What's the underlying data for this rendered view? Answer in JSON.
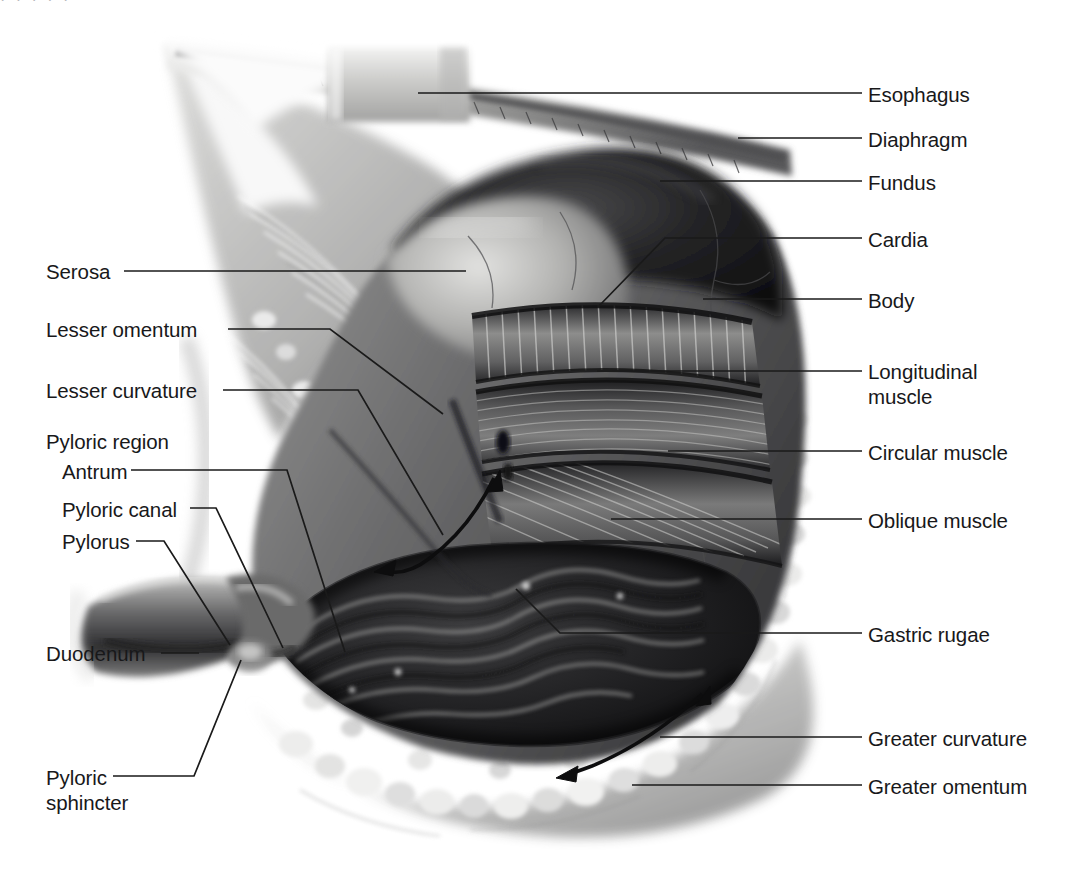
{
  "figure": {
    "style": "grayscale airbrush medical illustration, cutaway view",
    "background_color": "#ffffff",
    "label_color": "#18181a",
    "leader_color": "#1a1a1a",
    "width": 1081,
    "height": 874
  },
  "labels_right": [
    {
      "id": "esophagus",
      "text": "Esophagus",
      "x": 868,
      "y": 82,
      "leader": {
        "x1": 862,
        "y1": 93,
        "x2": 418,
        "y2": 93
      }
    },
    {
      "id": "diaphragm",
      "text": "Diaphragm",
      "x": 868,
      "y": 127,
      "leader": {
        "x1": 862,
        "y1": 138,
        "x2": 738,
        "y2": 138
      }
    },
    {
      "id": "fundus",
      "text": "Fundus",
      "x": 868,
      "y": 170,
      "leader": {
        "x1": 862,
        "y1": 181,
        "x2": 660,
        "y2": 181
      }
    },
    {
      "id": "cardia",
      "text": "Cardia",
      "x": 868,
      "y": 227,
      "leader": {
        "x1": 862,
        "y1": 238,
        "x2": 665,
        "y2": 238,
        "x3": 598,
        "y3": 307
      }
    },
    {
      "id": "body",
      "text": "Body",
      "x": 868,
      "y": 288,
      "leader": {
        "x1": 862,
        "y1": 299,
        "x2": 703,
        "y2": 299
      }
    },
    {
      "id": "longitudinal-muscle",
      "text": "Longitudinal\nmuscle",
      "x": 868,
      "y": 359,
      "leader": {
        "x1": 862,
        "y1": 371,
        "x2": 597,
        "y2": 371
      }
    },
    {
      "id": "circular-muscle",
      "text": "Circular muscle",
      "x": 868,
      "y": 440,
      "leader": {
        "x1": 862,
        "y1": 451,
        "x2": 668,
        "y2": 451
      }
    },
    {
      "id": "oblique-muscle",
      "text": "Oblique muscle",
      "x": 868,
      "y": 508,
      "leader": {
        "x1": 862,
        "y1": 519,
        "x2": 611,
        "y2": 519
      }
    },
    {
      "id": "gastric-rugae",
      "text": "Gastric rugae",
      "x": 868,
      "y": 622,
      "leader": {
        "x1": 862,
        "y1": 633,
        "x2": 560,
        "y2": 633,
        "x3": 516,
        "y3": 589
      }
    },
    {
      "id": "greater-curvature",
      "text": "Greater curvature",
      "x": 868,
      "y": 726,
      "leader": {
        "x1": 862,
        "y1": 737,
        "x2": 660,
        "y2": 737
      }
    },
    {
      "id": "greater-omentum",
      "text": "Greater omentum",
      "x": 868,
      "y": 774,
      "leader": {
        "x1": 862,
        "y1": 785,
        "x2": 632,
        "y2": 785
      }
    }
  ],
  "labels_left": [
    {
      "id": "serosa",
      "text": "Serosa",
      "x": 46,
      "y": 259,
      "indent": false,
      "leader": {
        "x1": 124,
        "y1": 271,
        "x2": 466,
        "y2": 271
      }
    },
    {
      "id": "lesser-omentum",
      "text": "Lesser omentum",
      "x": 46,
      "y": 317,
      "indent": false,
      "leader": {
        "x1": 228,
        "y1": 329,
        "x2": 330,
        "y2": 329,
        "x3": 443,
        "y3": 414
      }
    },
    {
      "id": "lesser-curvature",
      "text": "Lesser curvature",
      "x": 46,
      "y": 378,
      "indent": false,
      "leader": {
        "x1": 223,
        "y1": 390,
        "x2": 358,
        "y2": 390,
        "x3": 443,
        "y3": 535
      }
    },
    {
      "id": "pyloric-region",
      "text": "Pyloric region",
      "x": 46,
      "y": 429,
      "indent": false,
      "heading": true
    },
    {
      "id": "antrum",
      "text": "Antrum",
      "x": 62,
      "y": 459,
      "indent": true,
      "leader": {
        "x1": 131,
        "y1": 470,
        "x2": 287,
        "y2": 470,
        "x3": 345,
        "y3": 652
      }
    },
    {
      "id": "pyloric-canal",
      "text": "Pyloric canal",
      "x": 62,
      "y": 497,
      "indent": true,
      "leader": {
        "x1": 190,
        "y1": 508,
        "x2": 216,
        "y2": 508,
        "x3": 283,
        "y3": 648
      }
    },
    {
      "id": "pylorus",
      "text": "Pylorus",
      "x": 62,
      "y": 529,
      "indent": true,
      "leader": {
        "x1": 136,
        "y1": 541,
        "x2": 164,
        "y2": 541,
        "x3": 230,
        "y3": 645
      }
    },
    {
      "id": "duodenum",
      "text": "Duodenum",
      "x": 46,
      "y": 641,
      "indent": false,
      "leader": {
        "x1": 161,
        "y1": 653,
        "x2": 199,
        "y2": 653
      }
    },
    {
      "id": "pyloric-sphincter",
      "text": "Pyloric\nsphincter",
      "x": 46,
      "y": 765,
      "indent": false,
      "leader": {
        "x1": 113,
        "y1": 776,
        "x2": 194,
        "y2": 776,
        "x3": 241,
        "y3": 660
      }
    }
  ],
  "flow_arrows": [
    {
      "id": "lesser-curvature-peristalsis",
      "kind": "double-headed-curved-arrow",
      "note": "along lesser curvature"
    },
    {
      "id": "greater-curvature-peristalsis",
      "kind": "single-headed-curved-arrow",
      "note": "along greater curvature"
    }
  ],
  "art_regions": [
    {
      "id": "esophagus-tube",
      "name": "esophagus"
    },
    {
      "id": "diaphragm-sheet",
      "name": "diaphragm"
    },
    {
      "id": "fundus-dome",
      "name": "fundus"
    },
    {
      "id": "cardia-zone",
      "name": "cardia"
    },
    {
      "id": "body-wall",
      "name": "body"
    },
    {
      "id": "longitudinal-band",
      "name": "longitudinal muscle layer"
    },
    {
      "id": "circular-band",
      "name": "circular muscle layer"
    },
    {
      "id": "oblique-band",
      "name": "oblique muscle layer"
    },
    {
      "id": "rugae-folds",
      "name": "gastric rugae"
    },
    {
      "id": "greater-omentum-fat",
      "name": "greater omentum"
    },
    {
      "id": "lesser-omentum-sheet",
      "name": "lesser omentum"
    },
    {
      "id": "pylorus-neck",
      "name": "pylorus"
    },
    {
      "id": "duodenum-tube",
      "name": "duodenum"
    }
  ],
  "top_crumb": "· · · · ·"
}
